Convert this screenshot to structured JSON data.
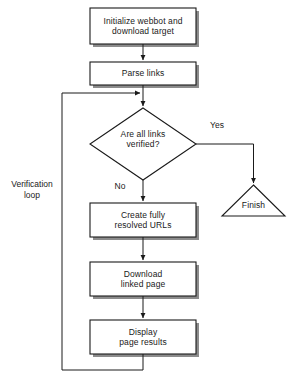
{
  "diagram": {
    "background_color": "#ffffff",
    "stroke_color": "#1a1a1a",
    "shadow_color": "#8c8c8c",
    "text_color": "#1a1a1a",
    "nodes": [
      {
        "id": "initialize",
        "shape": "process",
        "label": "Initialize webbot and\ndownload target",
        "x": 90,
        "y": 8,
        "w": 106,
        "h": 36
      },
      {
        "id": "parse-links",
        "shape": "process",
        "label": "Parse links",
        "x": 90,
        "y": 62,
        "w": 106,
        "h": 23
      },
      {
        "id": "are-all-links-verified",
        "shape": "decision",
        "label": "Are all links\nverified?",
        "cx": 143,
        "cy": 144,
        "rx": 53,
        "ry": 36
      },
      {
        "id": "create-resolved-urls",
        "shape": "process",
        "label": "Create fully\nresolved URLs",
        "x": 90,
        "y": 203,
        "w": 106,
        "h": 34
      },
      {
        "id": "download-linked-page",
        "shape": "process",
        "label": "Download\nlinked page",
        "x": 90,
        "y": 262,
        "w": 106,
        "h": 34
      },
      {
        "id": "display-page-results",
        "shape": "process",
        "label": "Display\npage results",
        "x": 90,
        "y": 320,
        "w": 106,
        "h": 34
      },
      {
        "id": "finish",
        "shape": "terminator-triangle",
        "label": "Finish",
        "x": 222,
        "y": 185,
        "w": 63,
        "h": 31
      }
    ],
    "edge_labels": [
      {
        "id": "yes-label",
        "text": "Yes",
        "x": 212,
        "y": 126
      },
      {
        "id": "no-label",
        "text": "No",
        "x": 117,
        "y": 184
      },
      {
        "id": "verification-loop-label",
        "text": "Verification\nloop",
        "x": 8,
        "y": 180
      }
    ]
  }
}
